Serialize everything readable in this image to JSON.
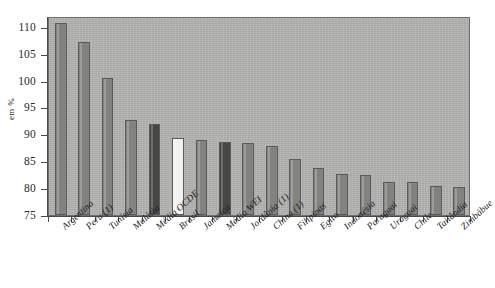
{
  "chart_data": {
    "type": "bar",
    "title": "",
    "subtitle": "",
    "xlabel": "",
    "ylabel": "em %",
    "ylim": [
      75,
      112
    ],
    "yticks": [
      75,
      80,
      85,
      90,
      95,
      100,
      105,
      110
    ],
    "ytick_labels": [
      "75",
      "80",
      "85",
      "90",
      "95",
      "100",
      "105",
      "110"
    ],
    "grid": false,
    "legend": "none",
    "categories": [
      "Argentina",
      "Peru (1)",
      "Tunísia",
      "Malásia",
      "Média OCDE",
      "Brasil",
      "Jamaica",
      "Média WEI",
      "Jordânia (1)",
      "China (1)",
      "Filipinas",
      "Egito",
      "Indonésia",
      "Paraguai",
      "Uruguai",
      "Chile",
      "Tailândia",
      "Zimbábue"
    ],
    "values": [
      110.7,
      107.2,
      100.5,
      92.6,
      91.9,
      89.4,
      89.0,
      88.5,
      88.3,
      87.9,
      85.5,
      83.8,
      82.6,
      82.4,
      81.2,
      81.2,
      80.4,
      80.3
    ],
    "bar_styles": [
      "normal",
      "normal",
      "normal",
      "normal",
      "dark",
      "light",
      "normal",
      "dark",
      "normal",
      "normal",
      "normal",
      "normal",
      "normal",
      "normal",
      "normal",
      "normal",
      "normal",
      "normal"
    ]
  },
  "colors": {
    "plot_background": "#b4b4b2",
    "bar_normal": "#82827f",
    "bar_dark": "#474746",
    "bar_light": "#f2f2ee",
    "axis": "#4a4a4a",
    "page_background": "#ffffff",
    "text": "#1d1d1d"
  }
}
